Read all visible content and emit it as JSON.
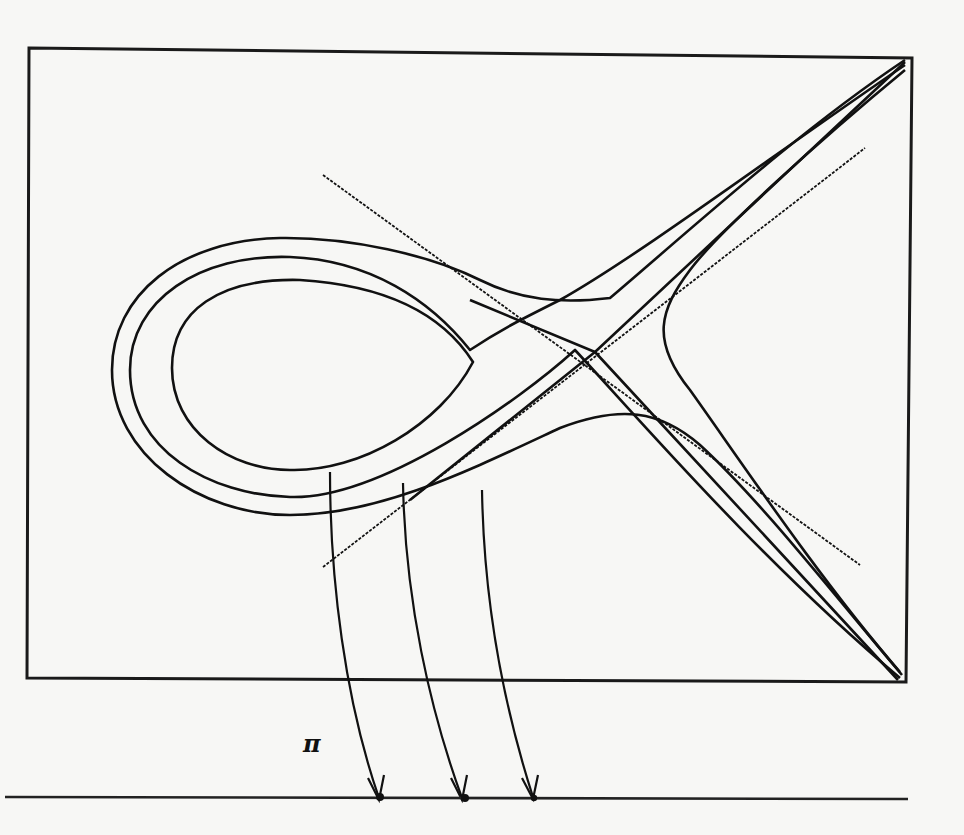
{
  "figure": {
    "projection_label": "π",
    "curve_count": 3,
    "fiber_arrows": 3,
    "base_points": 3,
    "colors": {
      "ink": "#111111",
      "paper": "#f7f7f5"
    }
  }
}
